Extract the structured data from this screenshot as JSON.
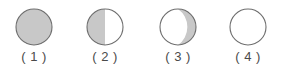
{
  "figure": {
    "background_color": "#ffffff",
    "shaded_color": "#c8c8c8",
    "unshaded_color": "#ffffff",
    "outline_color": "#6e6e6e",
    "label_color": "#4a4a4a",
    "items": [
      {
        "label": "( 1 )",
        "number": "1",
        "icon": "circle-fully-shaded-icon",
        "shading": "full",
        "shaded_fraction": 1.0,
        "center_x": 34
      },
      {
        "label": "( 2 )",
        "number": "2",
        "icon": "circle-half-shaded-left-icon",
        "shading": "left-half",
        "shaded_fraction": 0.5,
        "center_x": 105
      },
      {
        "label": "( 3 )",
        "number": "3",
        "icon": "circle-crescent-shaded-right-icon",
        "shading": "right-crescent",
        "shaded_fraction": 0.12,
        "center_x": 178
      },
      {
        "label": "( 4 )",
        "number": "4",
        "icon": "circle-unshaded-icon",
        "shading": "none",
        "shaded_fraction": 0.0,
        "center_x": 248
      }
    ]
  }
}
